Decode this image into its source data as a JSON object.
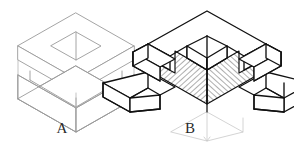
{
  "drawing": {
    "title": "Isometric assembly and cutaway section drawing",
    "background_color": "#ffffff",
    "figures": [
      {
        "id": "A",
        "label": "A",
        "label_position": {
          "x": 62,
          "y": 131
        },
        "caption": "Exploded isometric view of two mating blocks",
        "style": "thin gray outline, no hatching",
        "line_color": "#9a9a9a",
        "line_width": 0.9,
        "parts": [
          {
            "name": "upper-block",
            "feature": "square recess with central slot on top face"
          },
          {
            "name": "lower-block",
            "feature": "rectangular channel recess on top face"
          }
        ]
      },
      {
        "id": "B",
        "label": "B",
        "label_position": {
          "x": 207,
          "y": 131
        },
        "caption": "Assembled cutaway section view with hatched cut faces",
        "style": "bold black outline with 45 degree section hatching",
        "line_color": "#111111",
        "line_width": 1.4,
        "hatch_color": "#3a3a3a",
        "hatch_angle_deg": 45,
        "construction_line_color": "#c9c9c9",
        "parts": [
          {
            "name": "top-block",
            "feature": "quarter quadrant removed to expose interior"
          },
          {
            "name": "left-arm",
            "feature": "stepped notch arm"
          },
          {
            "name": "right-arm",
            "feature": "stepped notch arm"
          },
          {
            "name": "core-section",
            "feature": "hatched cut core at center"
          }
        ]
      }
    ]
  }
}
